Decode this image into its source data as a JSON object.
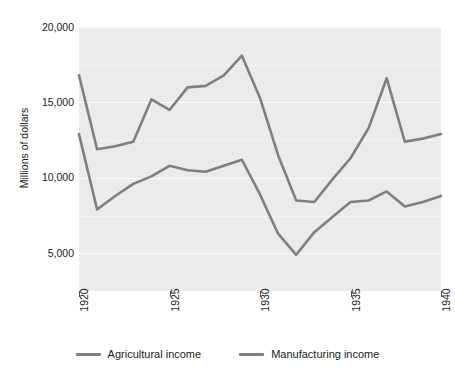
{
  "chart_data": {
    "type": "line",
    "title": "",
    "xlabel": "",
    "ylabel": "Millions of dollars",
    "xlim": [
      1920,
      1940
    ],
    "ylim": [
      2500,
      20000
    ],
    "grid": true,
    "legend_position": "bottom",
    "x": [
      1920,
      1921,
      1922,
      1923,
      1924,
      1925,
      1926,
      1927,
      1928,
      1929,
      1930,
      1931,
      1932,
      1933,
      1934,
      1935,
      1936,
      1937,
      1938,
      1939,
      1940
    ],
    "series": [
      {
        "name": "Agricultural income",
        "color": "#7f7f7f",
        "values": [
          12900,
          7900,
          8800,
          9600,
          10100,
          10800,
          10500,
          10400,
          10800,
          11200,
          8900,
          6300,
          4900,
          6400,
          7400,
          8400,
          8500,
          9100,
          8100,
          8400,
          8800
        ]
      },
      {
        "name": "Manufacturing income",
        "color": "#7f7f7f",
        "values": [
          16800,
          11900,
          12100,
          12400,
          15200,
          14500,
          16000,
          16100,
          16800,
          18100,
          15300,
          11500,
          8500,
          8400,
          9900,
          11300,
          13300,
          16600,
          12400,
          12600,
          12900
        ]
      }
    ],
    "y_ticks": [
      {
        "value": 5000,
        "label": "5,000"
      },
      {
        "value": 10000,
        "label": "10,000"
      },
      {
        "value": 15000,
        "label": "15,000"
      },
      {
        "value": 20000,
        "label": "20,000"
      }
    ],
    "x_ticks": [
      {
        "value": 1920,
        "label": "1920"
      },
      {
        "value": 1925,
        "label": "1925"
      },
      {
        "value": 1930,
        "label": "1930"
      },
      {
        "value": 1935,
        "label": "1935"
      },
      {
        "value": 1940,
        "label": "1940"
      }
    ],
    "plot_background": "#ebebeb",
    "gridline_color": "#fbfbfb",
    "figure_background": "#ffffff"
  },
  "legend": {
    "items": [
      {
        "label": "Agricultural income"
      },
      {
        "label": "Manufacturing income"
      }
    ]
  },
  "axes": {
    "y_title": "Millions of dollars"
  }
}
